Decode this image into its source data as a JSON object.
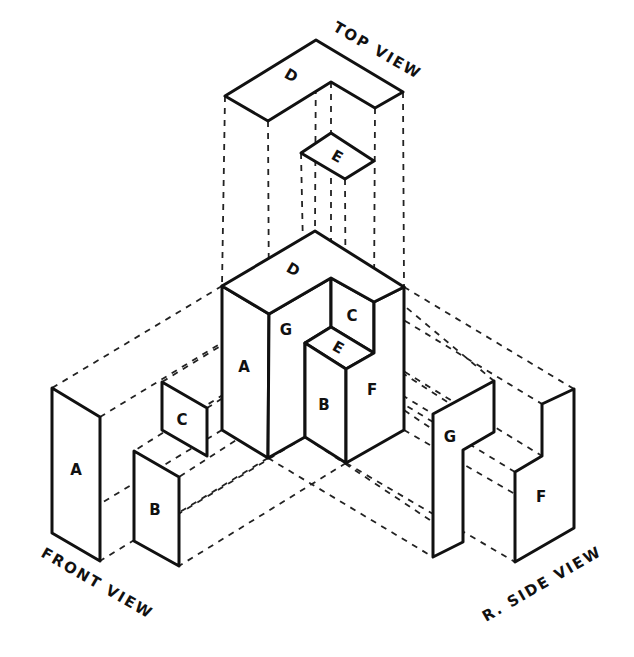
{
  "diagram": {
    "type": "isometric-orthographic-projection",
    "view_labels": {
      "top": "TOP VIEW",
      "front": "FRONT VIEW",
      "side": "R. SIDE VIEW"
    },
    "object_faces": {
      "A": "A",
      "B": "B",
      "C": "C",
      "D": "D",
      "E": "E",
      "F": "F",
      "G": "G"
    },
    "top_view_faces": {
      "D": "D",
      "E": "E"
    },
    "front_view_faces": {
      "A": "A",
      "B": "B",
      "C": "C"
    },
    "side_view_faces": {
      "G": "G",
      "F": "F"
    },
    "colors": {
      "line": "#111111",
      "background": "#ffffff"
    }
  }
}
